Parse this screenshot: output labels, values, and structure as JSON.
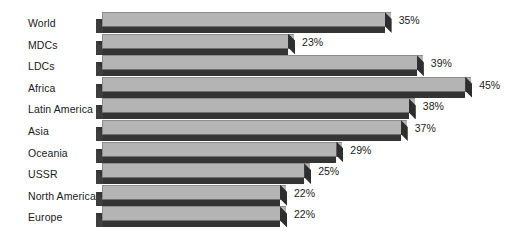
{
  "chart_data": {
    "type": "bar",
    "orientation": "horizontal",
    "style": "3d",
    "title": "",
    "subtitle": "",
    "xlabel": "",
    "ylabel": "",
    "grid": false,
    "legend": null,
    "axis_visible": false,
    "value_suffix": "%",
    "xlim": [
      0,
      45
    ],
    "categories": [
      "World",
      "MDCs",
      "LDCs",
      "Africa",
      "Latin America",
      "Asia",
      "Oceania",
      "USSR",
      "North America",
      "Europe"
    ],
    "values": [
      35,
      23,
      39,
      45,
      38,
      37,
      29,
      25,
      22,
      22
    ],
    "data_labels": [
      "35%",
      "23%",
      "39%",
      "45%",
      "38%",
      "37%",
      "29%",
      "25%",
      "22%",
      "22%"
    ],
    "colors": {
      "bar_top_face": "#b4b4b4",
      "bar_side_face": "#343434",
      "bar_edge": "#8d8d8d",
      "background": "#ffffff",
      "label_text": "#1a1a1a"
    },
    "points": [
      {
        "category": "World",
        "value": 35,
        "label": "35%"
      },
      {
        "category": "MDCs",
        "value": 23,
        "label": "23%"
      },
      {
        "category": "LDCs",
        "value": 39,
        "label": "39%"
      },
      {
        "category": "Africa",
        "value": 45,
        "label": "45%"
      },
      {
        "category": "Latin America",
        "value": 38,
        "label": "38%"
      },
      {
        "category": "Asia",
        "value": 37,
        "label": "37%"
      },
      {
        "category": "Oceania",
        "value": 29,
        "label": "29%"
      },
      {
        "category": "USSR",
        "value": 25,
        "label": "25%"
      },
      {
        "category": "North America",
        "value": 22,
        "label": "22%"
      },
      {
        "category": "Europe",
        "value": 22,
        "label": "22%"
      }
    ]
  },
  "layout": {
    "plot_left_px": 96,
    "row_top_px": 12,
    "row_pitch_px": 21.6,
    "px_per_unit": 8.05,
    "min_bar_px": 184
  }
}
